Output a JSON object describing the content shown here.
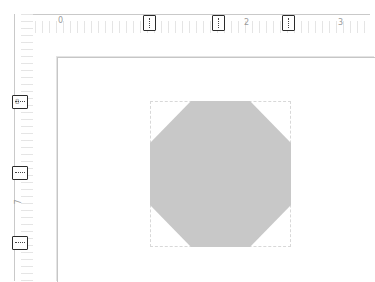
{
  "rulers": {
    "horizontal": {
      "labels": [
        {
          "text": "0",
          "x": 58
        },
        {
          "text": "2",
          "x": 244
        },
        {
          "text": "3",
          "x": 338
        }
      ],
      "markers": [
        {
          "name": "tab-marker-1",
          "x": 143
        },
        {
          "name": "tab-marker-2",
          "x": 212
        },
        {
          "name": "tab-marker-3",
          "x": 282
        }
      ]
    },
    "vertical": {
      "labels": [
        {
          "text": "7",
          "y": 198
        }
      ],
      "markers": [
        {
          "name": "margin-marker-top",
          "y": 95,
          "label": "8"
        },
        {
          "name": "margin-marker-mid",
          "y": 166,
          "label": ""
        },
        {
          "name": "margin-marker-bottom",
          "y": 236,
          "label": ""
        }
      ]
    }
  },
  "canvas": {
    "shape": {
      "type": "octagon",
      "fill": "#c8c8c8",
      "selected": true
    }
  }
}
